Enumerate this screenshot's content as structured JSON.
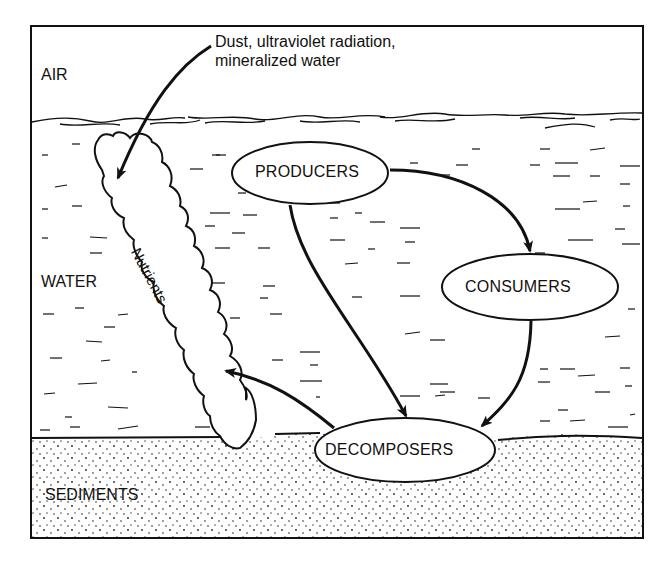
{
  "diagram": {
    "zones": {
      "air": "AIR",
      "water": "WATER",
      "sediments": "SEDIMENTS"
    },
    "inputs_label": {
      "line1": "Dust, ultraviolet radiation,",
      "line2": "mineralized water"
    },
    "nutrients_label": "Nutrients",
    "nodes": {
      "producers": "PRODUCERS",
      "consumers": "CONSUMERS",
      "decomposers": "DECOMPOSERS"
    },
    "edges": [
      {
        "from": "inputs",
        "to": "nutrients"
      },
      {
        "from": "producers",
        "to": "consumers"
      },
      {
        "from": "producers",
        "to": "decomposers"
      },
      {
        "from": "consumers",
        "to": "decomposers"
      },
      {
        "from": "decomposers",
        "to": "nutrients"
      }
    ],
    "colors": {
      "ink": "#111111",
      "background": "#ffffff"
    }
  }
}
